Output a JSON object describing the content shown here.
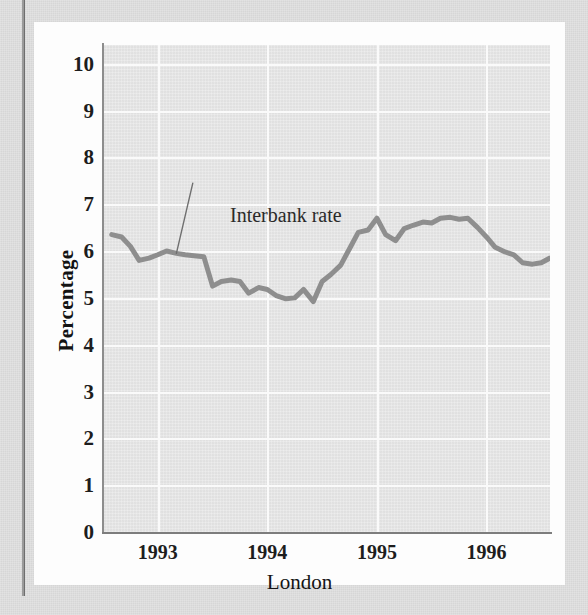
{
  "figure": {
    "series_label": "Interbank rate",
    "ylabel": "Percentage",
    "xlabel": "London"
  },
  "chart_data": {
    "type": "line",
    "title": "",
    "subtitle": "",
    "xlabel": "London",
    "ylabel": "Percentage",
    "ylim": [
      0,
      10.4
    ],
    "xlim": [
      1992.5,
      1996.58
    ],
    "yticks": [
      0,
      1,
      2,
      3,
      4,
      5,
      6,
      7,
      8,
      9,
      10
    ],
    "ytick_labels": [
      "0",
      "1",
      "2",
      "3",
      "4",
      "5",
      "6",
      "7",
      "8",
      "9",
      "10"
    ],
    "xticks": [
      1993,
      1994,
      1995,
      1996
    ],
    "xtick_labels": [
      "1993",
      "1994",
      "1995",
      "1996"
    ],
    "grid": true,
    "grid_color": "#fafafa",
    "plot_background": "#e6e6e6",
    "legend": false,
    "annotations": [
      {
        "text": "Interbank rate",
        "text_x": 1993.32,
        "text_y": 7.45,
        "point_x": 1993.17,
        "point_y": 5.95
      }
    ],
    "series": [
      {
        "name": "Interbank rate",
        "color": "#8e8e8e",
        "line_width": 5,
        "x": [
          1992.58,
          1992.67,
          1992.75,
          1992.83,
          1992.92,
          1993.0,
          1993.08,
          1993.17,
          1993.25,
          1993.33,
          1993.42,
          1993.5,
          1993.58,
          1993.67,
          1993.75,
          1993.83,
          1993.92,
          1994.0,
          1994.08,
          1994.17,
          1994.25,
          1994.33,
          1994.42,
          1994.5,
          1994.58,
          1994.67,
          1994.75,
          1994.83,
          1994.92,
          1995.0,
          1995.08,
          1995.17,
          1995.25,
          1995.33,
          1995.42,
          1995.5,
          1995.58,
          1995.67,
          1995.75,
          1995.83,
          1995.92,
          1996.0,
          1996.08,
          1996.17,
          1996.25,
          1996.33,
          1996.42,
          1996.5,
          1996.58
        ],
        "y": [
          6.35,
          6.3,
          6.1,
          5.8,
          5.85,
          5.92,
          6.0,
          5.95,
          5.92,
          5.9,
          5.88,
          5.25,
          5.35,
          5.38,
          5.35,
          5.1,
          5.22,
          5.18,
          5.05,
          4.98,
          5.0,
          5.18,
          4.92,
          5.35,
          5.5,
          5.7,
          6.05,
          6.4,
          6.45,
          6.7,
          6.35,
          6.22,
          6.48,
          6.55,
          6.62,
          6.6,
          6.7,
          6.72,
          6.68,
          6.7,
          6.5,
          6.3,
          6.08,
          5.98,
          5.92,
          5.75,
          5.72,
          5.75,
          5.85
        ]
      }
    ]
  }
}
